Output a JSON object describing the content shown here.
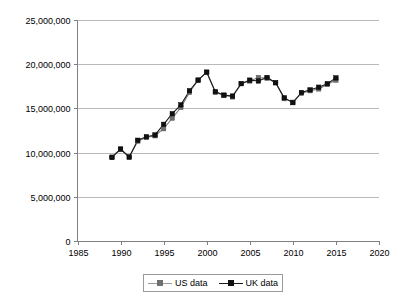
{
  "chart_data": {
    "type": "line",
    "title": "",
    "subtitle": "",
    "xlabel": "",
    "ylabel": "",
    "xlim": [
      1985,
      2020
    ],
    "ylim": [
      0,
      25000000
    ],
    "xticks": [
      1985,
      1990,
      1995,
      2000,
      2005,
      2010,
      2015,
      2020
    ],
    "yticks": [
      0,
      5000000,
      10000000,
      15000000,
      20000000,
      25000000
    ],
    "xtick_labels": [
      "1985",
      "1990",
      "1995",
      "2000",
      "2005",
      "2010",
      "2015",
      "2020"
    ],
    "ytick_labels": [
      "0",
      "5,000,000",
      "10,000,000",
      "15,000,000",
      "20,000,000",
      "25,000,000"
    ],
    "grid": true,
    "grid_axis": "y",
    "legend_position": "bottom",
    "x": [
      1989,
      1990,
      1991,
      1992,
      1993,
      1994,
      1995,
      1996,
      1997,
      1998,
      1999,
      2000,
      2001,
      2002,
      2003,
      2004,
      2005,
      2006,
      2007,
      2008,
      2009,
      2010,
      2011,
      2012,
      2013,
      2014,
      2015
    ],
    "series": [
      {
        "name": "US data",
        "color": "#6f6f6f",
        "marker": "square",
        "values": [
          9500000,
          10400000,
          9500000,
          11300000,
          11700000,
          11900000,
          12700000,
          13900000,
          15100000,
          16800000,
          18200000,
          19100000,
          16800000,
          16500000,
          16300000,
          17800000,
          18100000,
          18500000,
          18400000,
          17900000,
          16100000,
          15700000,
          16700000,
          17000000,
          17200000,
          17700000,
          18200000
        ]
      },
      {
        "name": "UK data",
        "color": "#111111",
        "marker": "square",
        "values": [
          9450000,
          10400000,
          9500000,
          11400000,
          11800000,
          12000000,
          13200000,
          14400000,
          15400000,
          17000000,
          18200000,
          19100000,
          16900000,
          16500000,
          16400000,
          17800000,
          18200000,
          18100000,
          18500000,
          17900000,
          16200000,
          15650000,
          16800000,
          17100000,
          17400000,
          17800000,
          18450000
        ]
      }
    ],
    "legend": [
      {
        "label": "US data",
        "color": "#6f6f6f"
      },
      {
        "label": "UK data",
        "color": "#111111"
      }
    ]
  }
}
